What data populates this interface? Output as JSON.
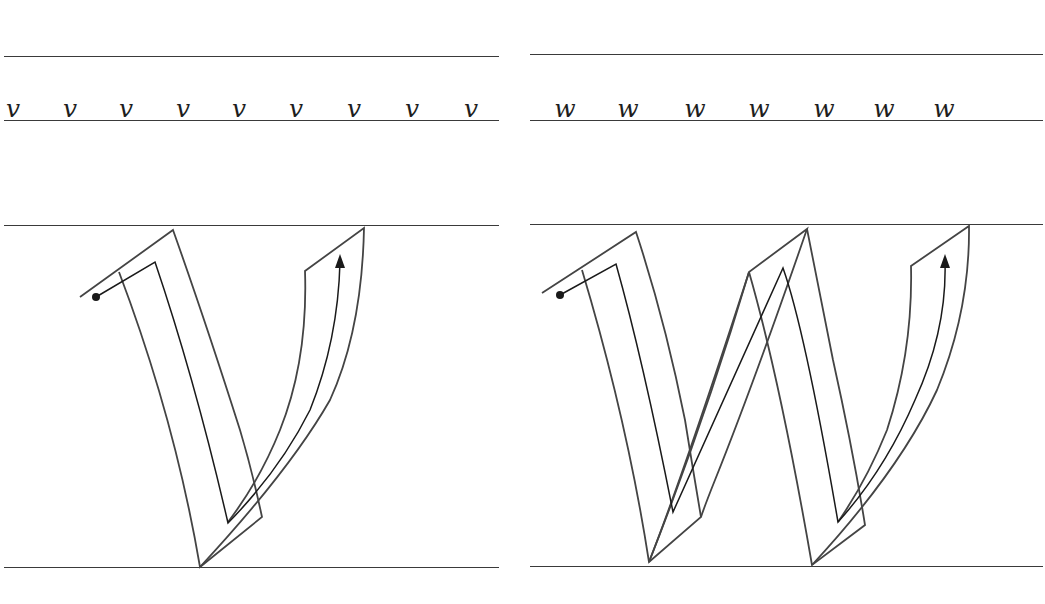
{
  "colors": {
    "background": "#ffffff",
    "rule": "#3a3a3a",
    "outline": "#444444",
    "stroke_path": "#1a1a1a"
  },
  "panels": [
    {
      "id": "v",
      "letter": "v",
      "sample_row": [
        "v",
        "v",
        "v",
        "v",
        "v",
        "v",
        "v",
        "v",
        "v"
      ],
      "large_glyph": "v",
      "start_marker": "start-dot",
      "end_marker": "arrow-up"
    },
    {
      "id": "w",
      "letter": "w",
      "sample_row": [
        "w",
        "w",
        "w",
        "w",
        "w",
        "w",
        "w"
      ],
      "large_glyph": "w",
      "start_marker": "start-dot",
      "end_marker": "arrow-up"
    }
  ]
}
